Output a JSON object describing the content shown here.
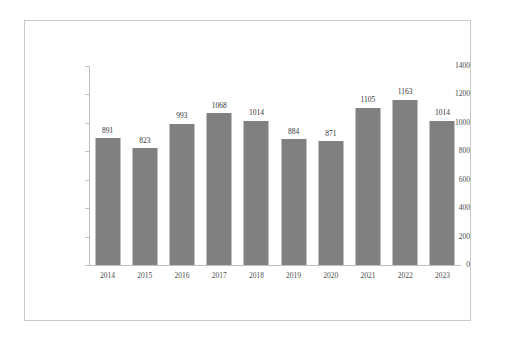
{
  "chart_data": {
    "type": "bar",
    "title": "",
    "subtitle": "",
    "xlabel": "",
    "ylabel": "",
    "categories": [
      "2014",
      "2015",
      "2016",
      "2017",
      "2018",
      "2019",
      "2020",
      "2021",
      "2022",
      "2023"
    ],
    "values": [
      891,
      823,
      993,
      1068,
      1014,
      884,
      871,
      1105,
      1163,
      1014
    ],
    "data_labels": [
      "891",
      "823",
      "993",
      "1068",
      "1014",
      "884",
      "871",
      "1105",
      "1163",
      "1014"
    ],
    "ylim": [
      0,
      1400
    ],
    "y_ticks": [
      0,
      200,
      400,
      600,
      800,
      1000,
      1200,
      1400
    ],
    "y_tick_labels": [
      "0",
      "200",
      "400",
      "600",
      "800",
      "1000",
      "1200",
      "1400"
    ],
    "grid": false,
    "legend": null,
    "legend_position": "none",
    "series": [
      {
        "name": "",
        "values": [
          891,
          823,
          993,
          1068,
          1014,
          884,
          871,
          1105,
          1163,
          1014
        ],
        "color": "#808080"
      }
    ],
    "colors": {
      "bar": "#808080",
      "axis": "#bfbfbf",
      "frame": "#c9c9c9",
      "text": "#4d4d4d",
      "value_text": "#333333",
      "background": "#ffffff"
    }
  }
}
